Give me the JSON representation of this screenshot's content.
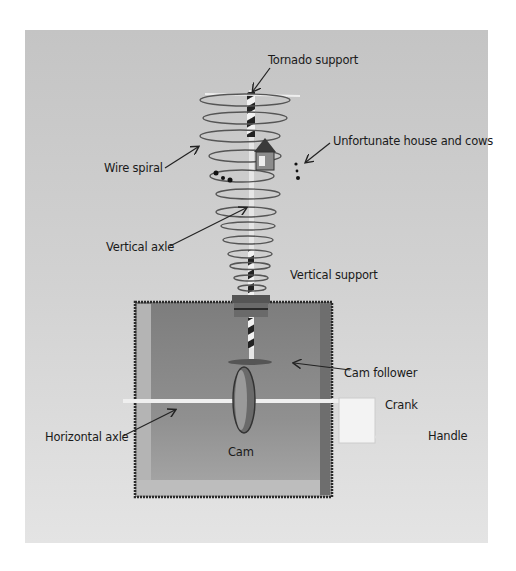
{
  "figure": {
    "background_color": "#c9c9c9",
    "box_color": "#8a8a8a",
    "labels": {
      "tornado_support": "Tornado support",
      "unfortunate_house_and_cows": "Unfortunate house and cows",
      "wire_spiral": "Wire spiral",
      "vertical_axle": "Vertical axle",
      "vertical_support": "Vertical support",
      "cam_follower": "Cam follower",
      "crank": "Crank",
      "handle": "Handle",
      "horizontal_axle": "Horizontal axle",
      "cam": "Cam"
    }
  }
}
